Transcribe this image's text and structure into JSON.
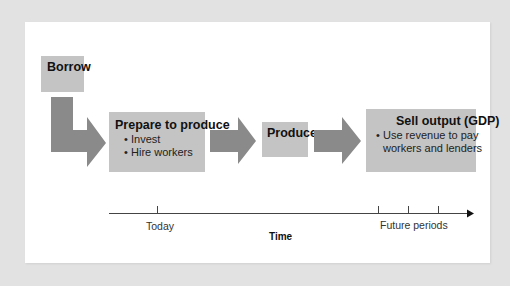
{
  "colors": {
    "background": "#e2e2e2",
    "card": "#ffffff",
    "box_fill": "#c4c4c4",
    "arrow_fill": "#8a8a8a",
    "axis_line": "#444444"
  },
  "diagram": {
    "boxes": {
      "borrow": {
        "title": "Borrow"
      },
      "prepare": {
        "title": "Prepare to produce",
        "bullets": [
          "Invest",
          "Hire workers"
        ]
      },
      "produce": {
        "title": "Produce"
      },
      "sell": {
        "title": "Sell output (GDP)",
        "bullets": [
          "Use revenue to pay",
          "workers and lenders"
        ]
      }
    },
    "bullet_glyph": "•",
    "arrows": [
      {
        "from": "Borrow",
        "to": "Prepare to produce",
        "shape": "bent-down-right"
      },
      {
        "from": "Prepare to produce",
        "to": "Produce",
        "shape": "right"
      },
      {
        "from": "Produce",
        "to": "Sell output (GDP)",
        "shape": "right"
      }
    ],
    "timeline": {
      "axis_label": "Time",
      "markers": [
        {
          "label": "Today"
        },
        {
          "label": "Future periods",
          "ticks": 3
        }
      ]
    }
  }
}
